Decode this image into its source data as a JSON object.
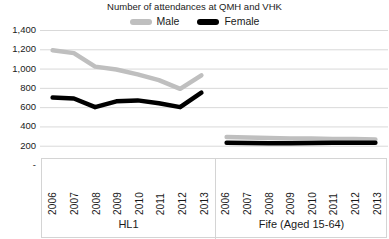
{
  "chart_data": {
    "type": "line",
    "title": "Number of attendances at QMH and VHK",
    "xlabel": "",
    "ylabel": "",
    "ylim": [
      0,
      1400
    ],
    "ytick_values": [
      1400,
      1200,
      1000,
      800,
      600,
      400,
      200,
      0
    ],
    "ytick_labels": [
      "1,400",
      "1,200",
      "1,000",
      "800",
      "600",
      "400",
      "200",
      "-"
    ],
    "grid": true,
    "legend_position": "top-center",
    "legend": [
      "Male",
      "Female"
    ],
    "groups": [
      {
        "name": "HL1",
        "categories": [
          "2006",
          "2007",
          "2008",
          "2009",
          "2010",
          "2011",
          "2012",
          "2013"
        ],
        "series": [
          {
            "name": "Male",
            "color": "#bfbfbf",
            "values": [
              1190,
              1160,
              1020,
              990,
              940,
              880,
              790,
              930
            ]
          },
          {
            "name": "Female",
            "color": "#000000",
            "values": [
              700,
              690,
              600,
              660,
              670,
              640,
              600,
              750
            ]
          }
        ]
      },
      {
        "name": "Fife (Aged 15-64)",
        "categories": [
          "2006",
          "2007",
          "2008",
          "2009",
          "2010",
          "2011",
          "2012",
          "2013"
        ],
        "series": [
          {
            "name": "Male",
            "color": "#bfbfbf",
            "values": [
              290,
              285,
              280,
              275,
              275,
              270,
              270,
              265
            ]
          },
          {
            "name": "Female",
            "color": "#000000",
            "values": [
              230,
              228,
              226,
              225,
              228,
              230,
              232,
              232
            ]
          }
        ]
      }
    ],
    "colors": {
      "male": "#bfbfbf",
      "female": "#000000",
      "gridline": "#d9d9d9",
      "axis_border": "#d4d4d4",
      "background": "#ffffff",
      "text": "#1a1a1a"
    }
  }
}
